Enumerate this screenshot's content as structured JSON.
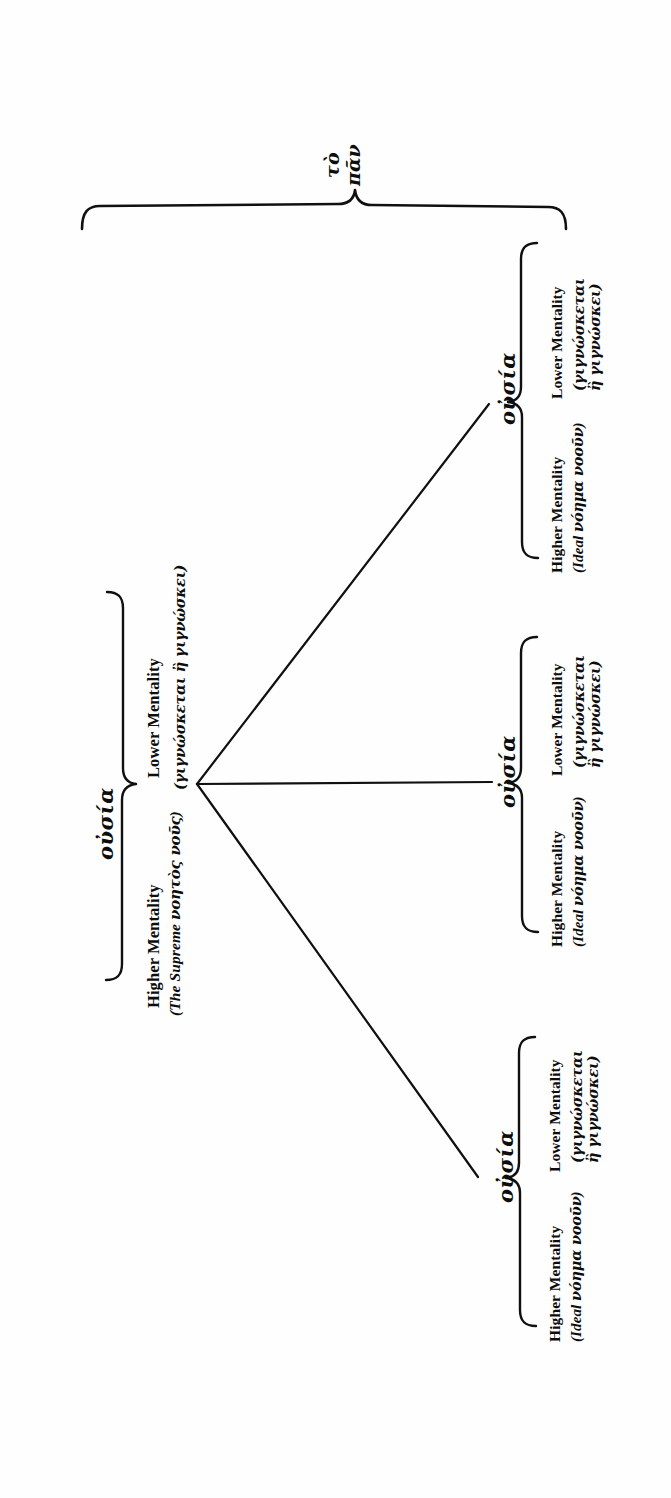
{
  "figure": {
    "kind": "tree-diagram",
    "orientation": "rotated-90-ccw",
    "root": {
      "label_line1": "τὸ",
      "label_line2": "πᾶν",
      "transliteration": "to pan"
    },
    "branches": [
      {
        "id": "branch-upper",
        "position": "upper",
        "ousia": "οὐσία",
        "higher_label": "Higher Mentality",
        "higher_gloss": "(Ideal νόημα νοοῦν)",
        "lower_label": "Lower Mentality",
        "lower_gloss_line1": "(γιγνώσκεται",
        "lower_gloss_line2": "ἢ γιγνώσκει)"
      },
      {
        "id": "branch-middle",
        "position": "middle",
        "ousia": "οὐσία",
        "higher_label": "Higher Mentality",
        "higher_gloss": "(Ideal νόημα νοοῦν)",
        "lower_label": "Lower Mentality",
        "lower_gloss_line1": "(γιγνώσκεται",
        "lower_gloss_line2": "ἢ γιγνώσκει)"
      },
      {
        "id": "branch-lower",
        "position": "lower",
        "ousia": "οὐσία",
        "higher_label": "Higher Mentality",
        "higher_gloss": "(Ideal νόημα νοοῦν)",
        "lower_label": "Lower Mentality",
        "lower_gloss_line1": "(γιγνώσκεται",
        "lower_gloss_line2": "ἢ γιγνώσκει)"
      }
    ],
    "trunk": {
      "id": "branch-trunk",
      "ousia": "οὐσία",
      "higher_label": "Higher Mentality",
      "higher_gloss": "(The Supreme νοητὸς νοῦς)",
      "lower_label": "Lower Mentality",
      "lower_gloss": "(γιγνώσκεται ἢ γιγνώσκει)"
    },
    "colors": {
      "ink": "#101010",
      "paper": "#fefefe"
    }
  }
}
